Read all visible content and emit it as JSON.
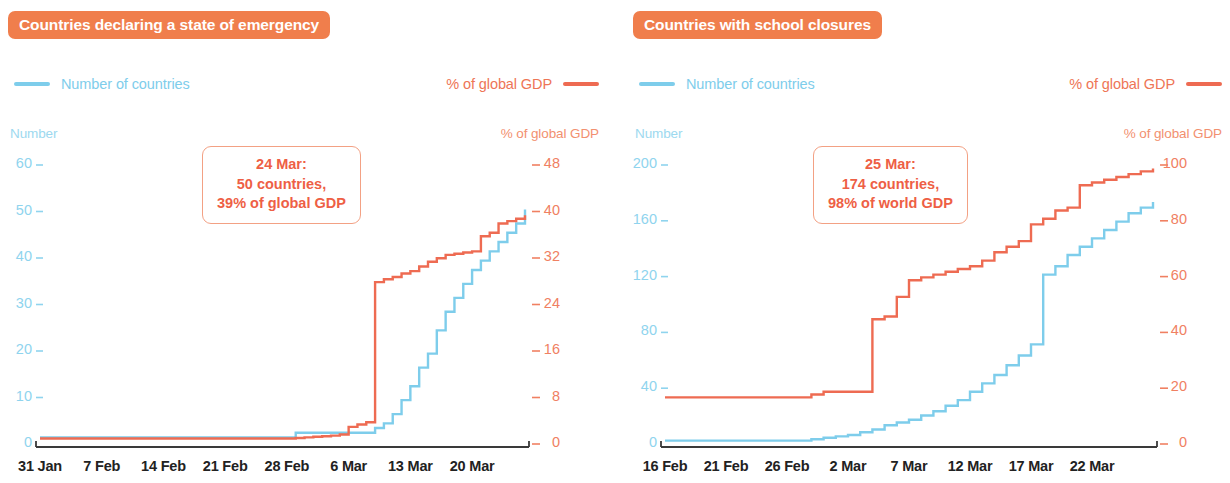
{
  "theme": {
    "badge_bg": "#F07E4C",
    "badge_text": "#FFFFFF",
    "blue": "#7ECDEB",
    "blue_tick": "#8FD4EE",
    "red": "#EE6B52",
    "red_tick": "#F08062",
    "callout_border": "#F3A184",
    "callout_text": "#EE5F45",
    "axis": "#3A3A3A"
  },
  "panels": [
    {
      "id": "emergency",
      "title": "Countries declaring a state of emergency",
      "legend": {
        "blue_label": "Number of countries",
        "red_label": "% of global GDP"
      },
      "axis_left_caption": "Number",
      "axis_right_caption": "% of global GDP",
      "callout": {
        "line1": "24 Mar:",
        "line2": "50 countries,",
        "line3": "39% of global GDP"
      },
      "chart_data": {
        "type": "line",
        "title": "Countries declaring a state of emergency",
        "xlabel": "",
        "ylabel": "Number",
        "y2label": "% of global GDP",
        "grid": false,
        "legend_position": "top",
        "ylim": [
          0,
          60
        ],
        "y2lim": [
          0,
          48
        ],
        "yticks": [
          0,
          10,
          20,
          30,
          40,
          50,
          60
        ],
        "y2ticks": [
          0,
          8,
          16,
          24,
          32,
          40,
          48
        ],
        "xticks": [
          "31 Jan",
          "7 Feb",
          "14 Feb",
          "21 Feb",
          "28 Feb",
          "6 Mar",
          "13 Mar",
          "20 Mar"
        ],
        "xtick_days": [
          0,
          7,
          14,
          21,
          28,
          35,
          42,
          49
        ],
        "x_days_range": [
          0,
          55
        ],
        "series": [
          {
            "name": "Number of countries",
            "axis": "left",
            "color": "#7ECDEB",
            "x_days": [
              0,
              2,
              5,
              8,
              11,
              14,
              17,
              20,
              23,
              26,
              28,
              29,
              30,
              31,
              32,
              33,
              34,
              35,
              36,
              37,
              38,
              39,
              40,
              41,
              42,
              43,
              44,
              45,
              46,
              47,
              48,
              49,
              50,
              51,
              52,
              53,
              54,
              55
            ],
            "values": [
              1,
              1,
              1,
              1,
              1,
              1,
              1,
              1,
              1,
              1,
              1,
              2,
              2,
              2,
              2,
              2,
              2,
              2,
              2,
              2,
              3,
              4,
              6,
              9,
              12,
              16,
              19,
              24,
              28,
              31,
              34,
              37,
              39,
              41,
              43,
              45,
              47,
              50
            ]
          },
          {
            "name": "% of global GDP",
            "axis": "right",
            "color": "#EE6B52",
            "x_days": [
              0,
              2,
              5,
              8,
              11,
              14,
              17,
              20,
              23,
              26,
              28,
              29,
              30,
              31,
              32,
              33,
              34,
              35,
              36,
              37,
              38,
              39,
              40,
              41,
              42,
              43,
              44,
              45,
              46,
              47,
              48,
              49,
              50,
              51,
              52,
              53,
              54,
              55
            ],
            "values": [
              0.6,
              0.6,
              0.6,
              0.6,
              0.6,
              0.6,
              0.6,
              0.6,
              0.6,
              0.6,
              0.6,
              0.7,
              0.8,
              0.9,
              1.0,
              1.1,
              1.3,
              2.6,
              3.0,
              3.4,
              27.5,
              28.0,
              28.4,
              29.0,
              29.4,
              30.2,
              31.0,
              31.6,
              32.2,
              32.4,
              32.6,
              32.8,
              35.4,
              36.0,
              37.6,
              38.0,
              38.4,
              39.0
            ]
          }
        ]
      }
    },
    {
      "id": "school",
      "title": "Countries with school closures",
      "legend": {
        "blue_label": "Number of countries",
        "red_label": "% of global GDP"
      },
      "axis_left_caption": "Number",
      "axis_right_caption": "% of global GDP",
      "callout": {
        "line1": "25 Mar:",
        "line2": "174 countries,",
        "line3": "98% of world GDP"
      },
      "chart_data": {
        "type": "line",
        "title": "Countries with school closures",
        "xlabel": "",
        "ylabel": "Number",
        "y2label": "% of global GDP",
        "grid": false,
        "legend_position": "top",
        "ylim": [
          0,
          200
        ],
        "y2lim": [
          0,
          100
        ],
        "yticks": [
          0,
          40,
          80,
          120,
          160,
          200
        ],
        "y2ticks": [
          0,
          20,
          40,
          60,
          80,
          100
        ],
        "xticks": [
          "16 Feb",
          "21 Feb",
          "26 Feb",
          "2 Mar",
          "7 Mar",
          "12 Mar",
          "17 Mar",
          "22 Mar"
        ],
        "xtick_days": [
          0,
          5,
          10,
          15,
          20,
          25,
          30,
          35
        ],
        "x_days_range": [
          0,
          40
        ],
        "series": [
          {
            "name": "Number of countries",
            "axis": "left",
            "color": "#7ECDEB",
            "x_days": [
              0,
              2,
              4,
              6,
              8,
              10,
              12,
              13,
              14,
              15,
              16,
              17,
              18,
              19,
              20,
              21,
              22,
              23,
              24,
              25,
              26,
              27,
              28,
              29,
              30,
              31,
              32,
              33,
              34,
              35,
              36,
              37,
              38,
              39,
              40
            ],
            "values": [
              1,
              1,
              1,
              1,
              1,
              1,
              2,
              3,
              4,
              5,
              7,
              9,
              12,
              14,
              16,
              19,
              22,
              26,
              30,
              36,
              42,
              48,
              55,
              62,
              70,
              120,
              126,
              134,
              140,
              146,
              152,
              158,
              164,
              168,
              172
            ]
          },
          {
            "name": "% of global GDP",
            "axis": "right",
            "color": "#EE6B52",
            "x_days": [
              0,
              2,
              4,
              6,
              8,
              10,
              12,
              13,
              14,
              15,
              16,
              17,
              18,
              19,
              20,
              21,
              22,
              23,
              24,
              25,
              26,
              27,
              28,
              29,
              30,
              31,
              32,
              33,
              34,
              35,
              36,
              37,
              38,
              39,
              40
            ],
            "values": [
              16,
              16,
              16,
              16,
              16,
              16,
              17,
              18,
              18,
              18,
              18,
              44,
              45,
              52,
              58,
              59,
              60,
              61,
              62,
              63,
              65,
              68,
              70,
              72,
              78,
              80,
              83,
              84,
              92,
              93,
              94,
              95,
              96,
              97,
              98
            ]
          }
        ]
      }
    }
  ]
}
